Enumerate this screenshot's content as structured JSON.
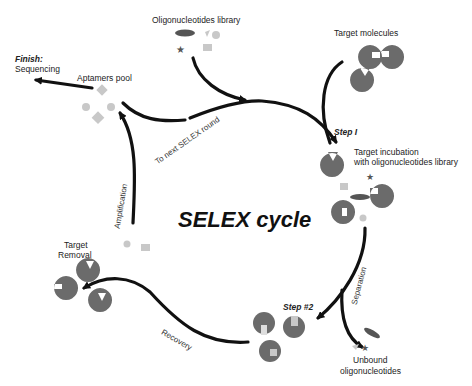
{
  "diagram": {
    "title": "SELEX cycle",
    "labels": {
      "oligo_library": "Oligonucleotides library",
      "target_molecules": "Target molecules",
      "finish": "Finish:",
      "sequencing": "Sequencing",
      "aptamers_pool": "Aptamers pool",
      "to_next_round": "To next SELEX round",
      "step1": "Step I",
      "target_incubation_1": "Target incubation",
      "target_incubation_2": "with oligonucleotides library",
      "amplification": "Amplification",
      "target_removal_1": "Target",
      "target_removal_2": "Removal",
      "separation": "Separation",
      "step2": "Step #2",
      "recovery": "Recovery",
      "unbound_1": "Unbound",
      "unbound_2": "oligonucleotides"
    },
    "colors": {
      "arrow": "#111111",
      "target": "#6b6b6b",
      "oligo_light": "#c8c8c8",
      "oligo_dark": "#555555"
    }
  }
}
